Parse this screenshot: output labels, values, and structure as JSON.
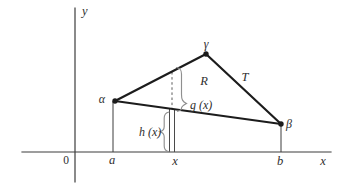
{
  "figure": {
    "axes": {
      "y_label": "y",
      "x_label": "x",
      "origin_label": "0"
    },
    "x_ticks": {
      "a": "a",
      "x": "x",
      "b": "b"
    },
    "vertex_labels": {
      "alpha": "α",
      "gamma": "γ",
      "beta": "β"
    },
    "labels": {
      "region": "R",
      "side": "T",
      "g_of_x": "g (x)",
      "h_of_x": "h (x)"
    }
  },
  "colors": {
    "background": "#ffffff",
    "line": "#1c1c1c",
    "axis": "#3c3c3c",
    "dashed": "#5a5a5a",
    "strip": "#4a4a4a",
    "brace": "#8f8f8f",
    "text": "#2e2e2e"
  }
}
